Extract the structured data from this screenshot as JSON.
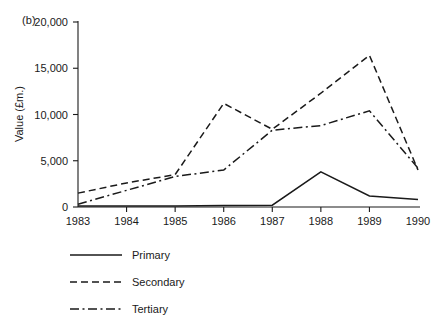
{
  "chart_data": {
    "type": "line",
    "title": "",
    "panel_label": "(b)",
    "xlabel": "",
    "ylabel": "Value (£m.)",
    "categories": [
      "1983",
      "1984",
      "1985",
      "1986",
      "1987",
      "1988",
      "1989",
      "1990"
    ],
    "x": [
      1983,
      1984,
      1985,
      1986,
      1987,
      1988,
      1989,
      1990
    ],
    "xlim": [
      1983,
      1990
    ],
    "ylim": [
      0,
      20000
    ],
    "yticks": [
      0,
      5000,
      10000,
      15000,
      20000
    ],
    "ytick_labels": [
      "0",
      "5,000",
      "10,000",
      "15,000",
      "20,000"
    ],
    "grid": false,
    "legend_position": "below-left",
    "series": [
      {
        "name": "Primary",
        "style": "solid",
        "color": "#1a1a1a",
        "values": [
          100,
          100,
          100,
          150,
          200,
          3800,
          1200,
          800
        ]
      },
      {
        "name": "Secondary",
        "style": "dashed",
        "color": "#1a1a1a",
        "values": [
          1500,
          2600,
          3500,
          11200,
          8400,
          12300,
          16400,
          4000
        ]
      },
      {
        "name": "Tertiary",
        "style": "dash-dot",
        "color": "#1a1a1a",
        "values": [
          300,
          1800,
          3300,
          4000,
          8300,
          8800,
          10400,
          4200
        ]
      }
    ]
  },
  "legend": {
    "items": [
      {
        "label": "Primary",
        "style": "solid"
      },
      {
        "label": "Secondary",
        "style": "dashed"
      },
      {
        "label": "Tertiary",
        "style": "dash-dot"
      }
    ]
  }
}
